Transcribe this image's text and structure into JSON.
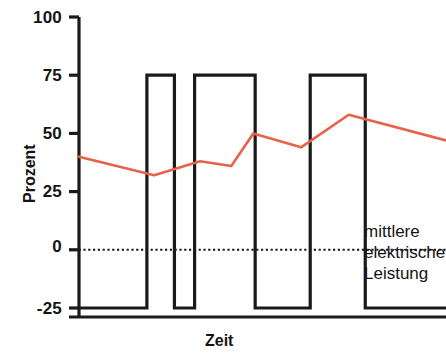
{
  "chart_data": {
    "type": "line",
    "title": "",
    "xlabel": "Zeit",
    "ylabel": "Prozent",
    "ylim": [
      -32,
      105
    ],
    "yticks": [
      100,
      75,
      50,
      25,
      0,
      -25
    ],
    "ytick_labels": [
      "100",
      "75",
      "50",
      "25",
      "0",
      "-25"
    ],
    "xticks": [],
    "xtick_labels": [],
    "grid": false,
    "legend_position": "inline-right",
    "zero_reference_line": {
      "value": 0,
      "style": "dotted",
      "color": "#1a1a1a"
    },
    "series": [
      {
        "name": "Leistung (Rechtecksignal)",
        "type": "step",
        "color": "#1a1a1a",
        "low_value": -25,
        "high_value": 75,
        "start_value": -25,
        "end_value": -25,
        "pulses": [
          {
            "start_pct": 18.5,
            "end_pct": 26.0
          },
          {
            "start_pct": 31.5,
            "end_pct": 48.0
          },
          {
            "start_pct": 63.0,
            "end_pct": 78.0
          }
        ]
      },
      {
        "name": "mittlere elektrische Leistung",
        "type": "line",
        "color": "#e8624a",
        "points": [
          {
            "x_pct": 0.0,
            "y": 40
          },
          {
            "x_pct": 20.5,
            "y": 32
          },
          {
            "x_pct": 33.0,
            "y": 38
          },
          {
            "x_pct": 41.5,
            "y": 36
          },
          {
            "x_pct": 47.5,
            "y": 50
          },
          {
            "x_pct": 60.5,
            "y": 44
          },
          {
            "x_pct": 73.5,
            "y": 58
          },
          {
            "x_pct": 100.0,
            "y": 47
          }
        ]
      }
    ],
    "annotations": [
      {
        "id": "mean-power-label",
        "lines": [
          "mittlere",
          "elektrische",
          "Leistung"
        ],
        "color": "#141414"
      }
    ]
  },
  "axis": {
    "y_title": "Prozent",
    "x_title": "Zeit"
  },
  "annotation_label": {
    "line1": "mittlere",
    "line2": "elektrische",
    "line3": "Leistung"
  },
  "ticks": {
    "t0": "100",
    "t1": "75",
    "t2": "50",
    "t3": "25",
    "t4": "0",
    "t5": "-25"
  },
  "colors": {
    "mean_line": "#e8624a",
    "signal_line": "#1a1a1a",
    "axis": "#1a1a1a"
  }
}
